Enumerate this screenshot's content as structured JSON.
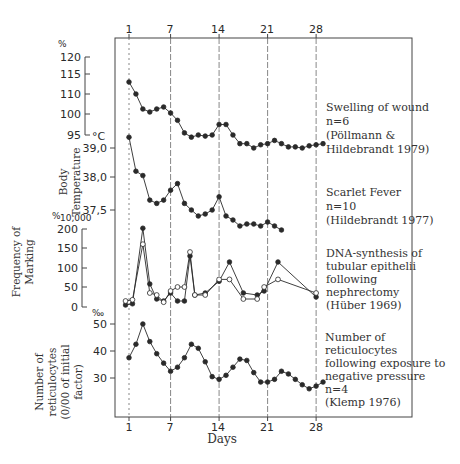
{
  "chart_data": {
    "type": "line",
    "xlabel": "Days",
    "x_ticks": [
      1,
      7,
      14,
      21,
      28
    ],
    "grid": "vertical dashed lines at days 1, 7, 14, 21, 28",
    "panels": [
      {
        "name": "Swelling of wound",
        "axis_unit": "%",
        "axis_ticks": [
          120,
          115,
          110,
          100,
          95
        ],
        "legend": [
          "Swelling of wound",
          "n=6",
          "(Pöllmann &",
          "Hildebrandt 1979)"
        ],
        "series": [
          {
            "name": "Swelling of wound",
            "marker": "filled",
            "x": [
              1,
              2,
              3,
              4,
              5,
              6,
              7,
              8,
              9,
              10,
              11,
              12,
              13,
              14,
              15,
              16,
              17,
              18,
              19,
              20,
              21,
              22,
              23,
              24,
              25,
              26,
              27,
              28,
              29
            ],
            "y": [
              113,
              110,
              102.5,
              101,
              102.5,
              103.5,
              100.5,
              98.5,
              95.5,
              94,
              95,
              94.5,
              95,
              97.5,
              97.5,
              95,
              91,
              91,
              89,
              90.5,
              91,
              92.5,
              91,
              89.5,
              89.5,
              89,
              90,
              90.5,
              91
            ]
          }
        ]
      },
      {
        "name": "Body Temperature",
        "axis_unit": "°C",
        "axis_ticks": [
          "39,0",
          "38,0",
          "37,5"
        ],
        "legend": [
          "Scarlet Fever",
          "n=10",
          "(Hildebrandt 1977)"
        ],
        "series": [
          {
            "name": "Scarlet Fever",
            "marker": "filled",
            "x": [
              1,
              2,
              3,
              4,
              5,
              6,
              7,
              8,
              9,
              10,
              11,
              12,
              13,
              14,
              15,
              16,
              17,
              18,
              19,
              20,
              21,
              22,
              23
            ],
            "y": [
              39.45,
              38.2,
              38.05,
              37.65,
              37.6,
              37.65,
              37.8,
              37.9,
              37.6,
              37.5,
              37.35,
              37.4,
              37.5,
              37.7,
              37.35,
              37.25,
              37.1,
              37.15,
              37.15,
              37.1,
              37.2,
              37.1,
              37.0
            ]
          }
        ]
      },
      {
        "name": "Frequency of Marking",
        "axis_unit": "‰₀ (per 10,000)",
        "axis_ticks": [
          200,
          150,
          100,
          50,
          0
        ],
        "legend": [
          "DNA-synthesis of",
          "tubular epithelii",
          "following",
          "nephrectomy",
          "(Hüber 1969)"
        ],
        "series": [
          {
            "name": "filled markers",
            "marker": "filled",
            "x": [
              0.5,
              1.5,
              3,
              4,
              5,
              6,
              7,
              8,
              9,
              9.8,
              10.5,
              12,
              14,
              15.5,
              17.5,
              19.5,
              20.5,
              22.5,
              28
            ],
            "y": [
              5,
              8,
              202,
              58,
              20,
              15,
              35,
              15,
              15,
              130,
              30,
              35,
              65,
              115,
              35,
              30,
              40,
              115,
              25
            ]
          },
          {
            "name": "open markers",
            "marker": "open",
            "x": [
              0.5,
              1.5,
              3,
              4,
              5,
              6,
              7,
              8,
              9,
              9.8,
              10.5,
              12,
              14,
              15.5,
              17.5,
              19.5,
              20.5,
              22.5,
              28
            ],
            "y": [
              15,
              18,
              160,
              35,
              30,
              12,
              40,
              50,
              50,
              140,
              30,
              30,
              70,
              70,
              20,
              20,
              50,
              70,
              35
            ]
          }
        ]
      },
      {
        "name": "Number of reticulocytes",
        "axis_unit": "‰",
        "axis_ticks": [
          50,
          40,
          30
        ],
        "legend": [
          "Number of",
          "reticulocytes",
          "following exposure to",
          "negative pressure",
          "n=4",
          "(Klemp 1976)"
        ],
        "series": [
          {
            "name": "Reticulocytes",
            "marker": "filled",
            "x": [
              1,
              2,
              3,
              4,
              5,
              6,
              7,
              8,
              9,
              10,
              11,
              12,
              13,
              14,
              15,
              16,
              17,
              18,
              19,
              20,
              21,
              22,
              23,
              24,
              25,
              26,
              27,
              28,
              29
            ],
            "y": [
              37.5,
              42.5,
              50,
              43.5,
              39,
              35.5,
              32.5,
              34,
              37.5,
              42.5,
              41,
              36,
              30.5,
              29.5,
              31,
              34,
              37,
              36.5,
              32,
              28.5,
              28.5,
              29.5,
              32.5,
              31.5,
              29.5,
              27.5,
              26,
              27,
              28.5
            ]
          }
        ]
      }
    ]
  },
  "labels": {
    "top_ticks": [
      "1",
      "7",
      "14",
      "21",
      "28"
    ],
    "bottom_ticks": [
      "1",
      "7",
      "14",
      "21",
      "28"
    ],
    "days": "Days",
    "swelling_unit": "%",
    "swelling_ticks": [
      "120",
      "115",
      "110",
      "100",
      "95"
    ],
    "temp_unit": "°C",
    "temp_ticks": [
      "39,0",
      "38,0",
      "37,5"
    ],
    "temp_ylabel": [
      "Body",
      "Temperature"
    ],
    "marking_unit": "%",
    "marking_unit_sub": "10,000",
    "marking_ticks": [
      "200",
      "150",
      "100",
      "50",
      "0"
    ],
    "marking_ylabel": [
      "Frequency of",
      "Marking"
    ],
    "retic_unit": "‰",
    "retic_ticks": [
      "50",
      "40",
      "30"
    ],
    "retic_ylabel": [
      "Number of",
      "reticulocytes",
      "(0/00 of initial",
      "factor)"
    ],
    "legend_swelling": [
      "Swelling of wound",
      "n=6",
      "(Pöllmann &",
      "Hildebrandt 1979)"
    ],
    "legend_fever": [
      "Scarlet Fever",
      "n=10",
      "(Hildebrandt 1977)"
    ],
    "legend_dna": [
      "DNA-synthesis of",
      "tubular epithelii",
      "following",
      "nephrectomy",
      "(Hüber 1969)"
    ],
    "legend_retic": [
      "Number of",
      "reticulocytes",
      "following exposure to",
      "negative pressure",
      "n=4",
      "(Klemp 1976)"
    ]
  },
  "colors": {
    "ink": "#2a2a2a",
    "grid": "#555555",
    "background": "#ffffff"
  }
}
